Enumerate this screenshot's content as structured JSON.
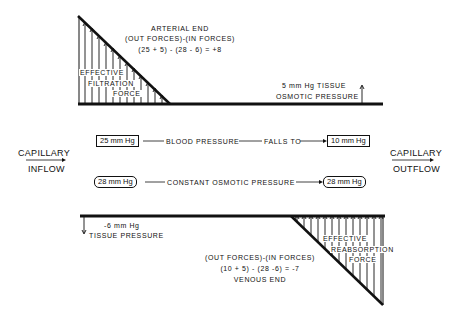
{
  "arterial": {
    "title": "ARTERIAL END",
    "formula_line1": "(OUT FORCES)-(IN FORCES)",
    "formula_line2": "(25 + 5) - (28 - 6) = +8"
  },
  "filtration_label": [
    "EFFECTIVE",
    "FILTRATION",
    "FORCE"
  ],
  "tissue_osmotic": [
    "5 mm Hg TISSUE",
    "OSMOTIC PRESSURE"
  ],
  "capillary_inflow": [
    "CAPILLARY",
    "INFLOW"
  ],
  "capillary_outflow": [
    "CAPILLARY",
    "OUTFLOW"
  ],
  "blood_pressure_row": {
    "start_value": "25 mm Hg",
    "label": "BLOOD PRESSURE",
    "middle": "FALLS TO",
    "end_value": "10 mm Hg"
  },
  "osmotic_row": {
    "start_value": "28 mm Hg",
    "label": "CONSTANT OSMOTIC PRESSURE",
    "end_value": "28 mm Hg"
  },
  "tissue_pressure": [
    "-6 mm Hg",
    "TISSUE PRESSURE"
  ],
  "venous": {
    "formula_line1": "(OUT FORCES)-(IN FORCES)",
    "formula_line2": "(10 + 5) - (28 -6) = -7",
    "title": "VENOUS END"
  },
  "reabsorption_label": [
    "EFFECTIVE",
    "REABSORPTION",
    "FORCE"
  ]
}
